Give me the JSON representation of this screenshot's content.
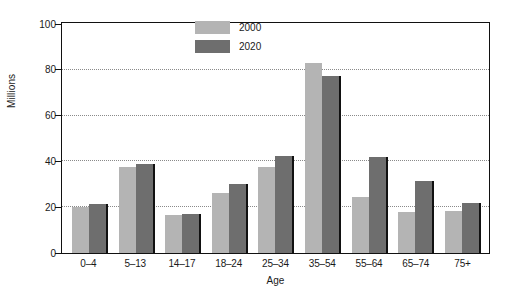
{
  "chart_data": {
    "type": "bar",
    "title": "",
    "xlabel": "Age",
    "ylabel": "Millions",
    "ylim": [
      0,
      100
    ],
    "yticks": [
      0,
      20,
      40,
      60,
      80,
      100
    ],
    "grid": true,
    "legend_position": "top-center",
    "categories": [
      "0–4",
      "5–13",
      "14–17",
      "18–24",
      "25–34",
      "35–54",
      "55–64",
      "65–74",
      "75+"
    ],
    "series": [
      {
        "name": "2000",
        "color": "#b4b4b4",
        "values": [
          20,
          37.5,
          16.5,
          26,
          37.5,
          83,
          24.5,
          18,
          18.5
        ]
      },
      {
        "name": "2020",
        "color": "#6e6e6e",
        "values": [
          21.5,
          39,
          17,
          30,
          42.5,
          77.5,
          42,
          31.5,
          22
        ]
      }
    ]
  }
}
